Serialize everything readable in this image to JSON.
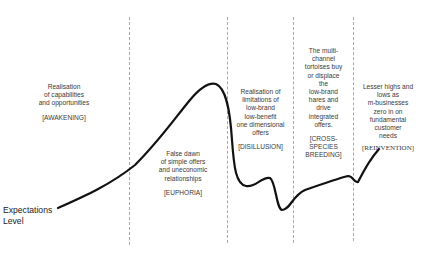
{
  "diagram": {
    "axis_label": [
      "Expectations",
      "Level"
    ],
    "phases": [
      {
        "id": "awakening",
        "lines": [
          "Realisation",
          "of capabilities",
          "and opportunities"
        ],
        "tag": "[AWAKENING]"
      },
      {
        "id": "euphoria",
        "lines": [
          "False dawn",
          "of simple offers",
          "and uneconomic",
          "relationships"
        ],
        "tag": "[EUPHORIA]"
      },
      {
        "id": "disillusion",
        "lines": [
          "Realisation of",
          "limitations of",
          "low-brand",
          "low-benefit",
          "one dimensional",
          "offers"
        ],
        "tag": "[DISILLUSION]"
      },
      {
        "id": "cross-species-breeding",
        "lines": [
          "The multi-",
          "channel",
          "tortoises buy",
          "or displace",
          "the",
          "low-brand",
          "hares and",
          "drive",
          "integrated",
          "offers."
        ],
        "tag_lines": [
          "[CROSS-",
          "SPECIES",
          "BREEDING]"
        ]
      },
      {
        "id": "reinvention",
        "lines": [
          "Lesser highs and",
          "lows as",
          "m-businesses",
          "zero in on",
          "fundamental",
          "customer",
          "needs"
        ],
        "tag": "[REINVENTION]"
      }
    ],
    "colors": {
      "curve": "#111111",
      "divider": "#a8a8a8",
      "text": "#3a3a3a"
    }
  }
}
